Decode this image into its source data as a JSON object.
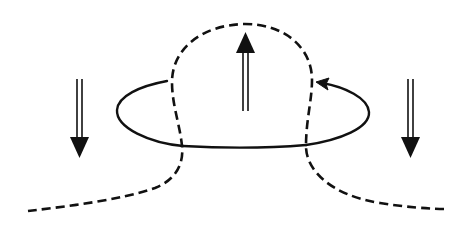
{
  "diagram": {
    "title": "",
    "background_color": "#ffffff",
    "stroke_color": "#111111",
    "elements": {
      "dashed_field_line": {
        "style": "dashed",
        "description": "Rising dashed loop (flux tube) with tails extending left and right"
      },
      "solid_current_loop": {
        "style": "solid",
        "direction": "counter-clockwise as viewed, arrowhead on upper right pointing left"
      },
      "arrows": [
        {
          "id": "left-down",
          "direction": "down",
          "style": "double-shaft"
        },
        {
          "id": "center-up",
          "direction": "up",
          "style": "double-shaft"
        },
        {
          "id": "right-down",
          "direction": "down",
          "style": "double-shaft"
        }
      ]
    }
  }
}
